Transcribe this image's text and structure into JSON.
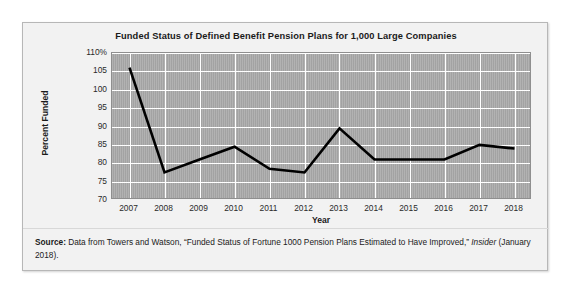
{
  "figure": {
    "title": "Funded Status of Defined Benefit Pension Plans for 1,000 Large Companies",
    "x_axis_title": "Year",
    "y_axis_title": "Percent Funded"
  },
  "source_note": {
    "label": "Source:",
    "text_before_italic": " Data from Towers and Watson, “Funded Status of Fortune 1000 Pension Plans Estimated to Have Improved,” ",
    "italic_text": "Insider",
    "text_after_italic": " (January 2018)."
  },
  "colors": {
    "plot_background": "#a9a9a9",
    "gridline": "#ffffff",
    "series_line": "#000000",
    "card_background": "#f2f2f2",
    "card_border": "#b7b7b7",
    "text": "#1b1b1b"
  },
  "chart_data": {
    "type": "line",
    "title": "Funded Status of Defined Benefit Pension Plans for 1,000 Large Companies",
    "xlabel": "Year",
    "ylabel": "Percent Funded",
    "x": [
      2007,
      2008,
      2009,
      2010,
      2011,
      2012,
      2013,
      2014,
      2015,
      2016,
      2017,
      2018
    ],
    "values": [
      106,
      77.5,
      81,
      84.5,
      78.5,
      77.5,
      89.5,
      81,
      81,
      81,
      85,
      84
    ],
    "xtick_labels": [
      "2007",
      "2008",
      "2009",
      "2010",
      "2011",
      "2012",
      "2013",
      "2014",
      "2015",
      "2016",
      "2017",
      "2018"
    ],
    "ytick_values": [
      110,
      105,
      100,
      95,
      90,
      85,
      80,
      75,
      70
    ],
    "ytick_labels": [
      "110%",
      "105",
      "100",
      "95",
      "90",
      "85",
      "80",
      "75",
      "70"
    ],
    "ylim": [
      70,
      110
    ],
    "xlim": [
      2006.5,
      2018.5
    ],
    "grid": true,
    "legend": "none",
    "reference_line": {
      "y": 100,
      "style": "dashed",
      "color": "#ffffff"
    }
  }
}
